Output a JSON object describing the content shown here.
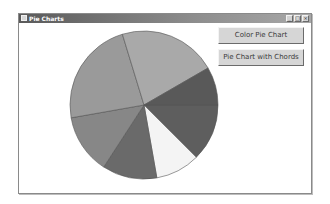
{
  "window": {
    "title": "Pie Charts",
    "controls": {
      "minimize": "_",
      "maximize": "□",
      "close": "×"
    }
  },
  "buttons": {
    "color_pie": "Color Pie Chart",
    "chords": "Pie Chart with Chords"
  },
  "chart_data": {
    "type": "pie",
    "title": "",
    "center": [
      143,
      105
    ],
    "radius": 74,
    "start_angle_deg": 0,
    "direction": "clockwise",
    "slices": [
      {
        "angle": 45,
        "color": "#5e5e5e"
      },
      {
        "angle": 35,
        "color": "#f4f4f4"
      },
      {
        "angle": 43,
        "color": "#6a6a6a"
      },
      {
        "angle": 47,
        "color": "#878787"
      },
      {
        "angle": 83,
        "color": "#9a9a9a"
      },
      {
        "angle": 77,
        "color": "#a9a9a9"
      },
      {
        "angle": 30,
        "color": "#595959"
      }
    ],
    "stroke": "#555555"
  }
}
